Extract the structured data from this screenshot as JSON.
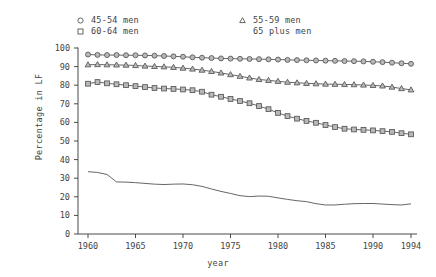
{
  "axes": {
    "ylabel": "Percentage in LF",
    "xlabel": "year",
    "yticks": [
      "100",
      "90",
      "80",
      "70",
      "60",
      "50",
      "40",
      "30",
      "20",
      "10",
      "0"
    ],
    "xticks": [
      "1960",
      "1965",
      "1970",
      "1975",
      "1980",
      "1985",
      "1990",
      "1994"
    ],
    "line_color": "#555555",
    "marker_face": "#b9b9b9"
  },
  "legend": {
    "entries": [
      {
        "label": "45-54 men",
        "marker": "circle-marker-icon"
      },
      {
        "label": "60-64 men",
        "marker": "square-marker-icon"
      },
      {
        "label": "55-59 men",
        "marker": "triangle-marker-icon"
      },
      {
        "label": "65 plus men",
        "marker": "no-marker"
      }
    ]
  },
  "chart_data": {
    "type": "line",
    "title": "",
    "xlabel": "year",
    "ylabel": "Percentage in LF",
    "xlim": [
      1960,
      1994
    ],
    "ylim": [
      0,
      100
    ],
    "grid": false,
    "legend_position": "top",
    "x": [
      1960,
      1961,
      1962,
      1963,
      1964,
      1965,
      1966,
      1967,
      1968,
      1969,
      1970,
      1971,
      1972,
      1973,
      1974,
      1975,
      1976,
      1977,
      1978,
      1979,
      1980,
      1981,
      1982,
      1983,
      1984,
      1985,
      1986,
      1987,
      1988,
      1989,
      1990,
      1991,
      1992,
      1993,
      1994
    ],
    "series": [
      {
        "name": "45-54 men",
        "marker": "circle",
        "values": [
          96.5,
          96.3,
          96.2,
          96.2,
          96.1,
          96.1,
          96.0,
          95.9,
          95.7,
          95.5,
          95.3,
          95.0,
          94.8,
          94.6,
          94.4,
          94.3,
          94.2,
          94.1,
          94.0,
          93.9,
          93.8,
          93.6,
          93.5,
          93.4,
          93.3,
          93.2,
          93.1,
          93.0,
          92.9,
          92.8,
          92.6,
          92.4,
          92.1,
          91.8,
          91.5
        ]
      },
      {
        "name": "55-59 men",
        "marker": "triangle",
        "values": [
          91.0,
          91.1,
          91.0,
          90.9,
          90.8,
          90.6,
          90.3,
          90.1,
          89.9,
          89.6,
          89.2,
          88.7,
          88.1,
          87.4,
          86.6,
          85.7,
          84.8,
          83.9,
          83.1,
          82.6,
          82.1,
          81.6,
          81.3,
          81.0,
          80.8,
          80.6,
          80.5,
          80.4,
          80.3,
          80.1,
          79.9,
          79.6,
          79.0,
          78.2,
          77.5
        ]
      },
      {
        "name": "60-64 men",
        "marker": "square",
        "values": [
          80.8,
          81.7,
          81.0,
          80.5,
          80.0,
          79.5,
          79.0,
          78.5,
          78.2,
          78.0,
          77.7,
          77.3,
          76.5,
          74.9,
          73.8,
          72.6,
          71.5,
          70.3,
          68.8,
          67.1,
          65.1,
          63.4,
          62.0,
          60.8,
          59.8,
          58.6,
          57.5,
          56.6,
          56.2,
          56.0,
          55.7,
          55.3,
          54.9,
          54.2,
          53.6
        ]
      },
      {
        "name": "65 plus men",
        "marker": "none",
        "values": [
          33.5,
          33.1,
          32.0,
          28.0,
          27.9,
          27.6,
          27.2,
          26.8,
          26.6,
          26.8,
          26.9,
          26.5,
          25.6,
          24.2,
          22.9,
          21.8,
          20.6,
          20.1,
          20.4,
          20.3,
          19.4,
          18.6,
          17.9,
          17.4,
          16.3,
          15.6,
          15.6,
          16.0,
          16.3,
          16.4,
          16.4,
          16.1,
          15.8,
          15.6,
          16.2
        ]
      }
    ]
  }
}
